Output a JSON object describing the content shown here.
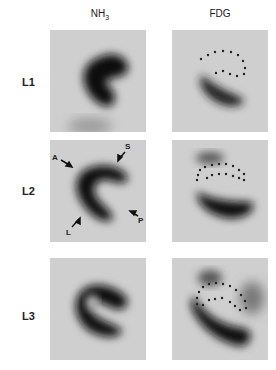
{
  "figure": {
    "columns": [
      {
        "label_main": "NH",
        "label_sub": "3"
      },
      {
        "label_main": "FDG",
        "label_sub": ""
      }
    ],
    "rows": [
      {
        "label": "L1"
      },
      {
        "label": "L2"
      },
      {
        "label": "L3"
      }
    ],
    "annotations": {
      "A": "A",
      "S": "S",
      "L": "L",
      "P": "P"
    },
    "colors": {
      "background_panel": "#cfcfcf",
      "uptake": "#111111",
      "dots": "#222222"
    }
  }
}
